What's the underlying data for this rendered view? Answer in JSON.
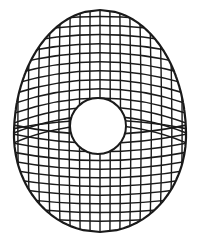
{
  "figure": {
    "colors": {
      "background": "#ffffff",
      "ink": "#1a1a1a"
    },
    "shape": {
      "outline": "egg",
      "center_x": 100,
      "top_y": 10,
      "bottom_y": 232,
      "half_width": 86,
      "widest_y": 135
    },
    "hole": {
      "cx": 98,
      "cy": 126,
      "r": 28
    },
    "grid": {
      "vertical_lines": 17,
      "upper_horizontal_lines": 13,
      "lower_horizontal_lines": 11
    }
  }
}
